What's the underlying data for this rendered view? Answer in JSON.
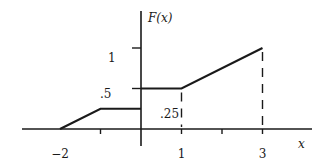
{
  "chart_data": {
    "type": "line",
    "title": "",
    "xlabel": "x",
    "ylabel": "F(x)",
    "xlim": [
      -3,
      4
    ],
    "ylim": [
      0,
      1.15
    ],
    "grid": false,
    "legend": "none",
    "x_ticks": [
      -1,
      1,
      2,
      3
    ],
    "x_tick_labels": [
      {
        "value": -2,
        "label": "−2"
      },
      {
        "value": 1,
        "label": "1"
      },
      {
        "value": 3,
        "label": "3"
      }
    ],
    "y_ticks": [
      0.5,
      1
    ],
    "y_tick_labels": [
      {
        "value": 1,
        "label": "1"
      },
      {
        "value": 0.5,
        "label": ".5"
      },
      {
        "value": 0.25,
        "label": ".25"
      }
    ],
    "series": [
      {
        "name": "F(x) segment 1",
        "style": "solid",
        "points": [
          [
            -2,
            0
          ],
          [
            -1,
            0.25
          ],
          [
            0,
            0.25
          ]
        ]
      },
      {
        "name": "F(x) segment 2",
        "style": "solid",
        "points": [
          [
            0,
            0.5
          ],
          [
            1,
            0.5
          ],
          [
            3,
            1
          ]
        ]
      }
    ],
    "guides": [
      {
        "name": "drop-line-x1",
        "style": "dashed",
        "points": [
          [
            1,
            0.5
          ],
          [
            1,
            0
          ]
        ]
      },
      {
        "name": "drop-line-x3",
        "style": "dashed",
        "points": [
          [
            3,
            1
          ],
          [
            3,
            0
          ]
        ]
      }
    ]
  }
}
